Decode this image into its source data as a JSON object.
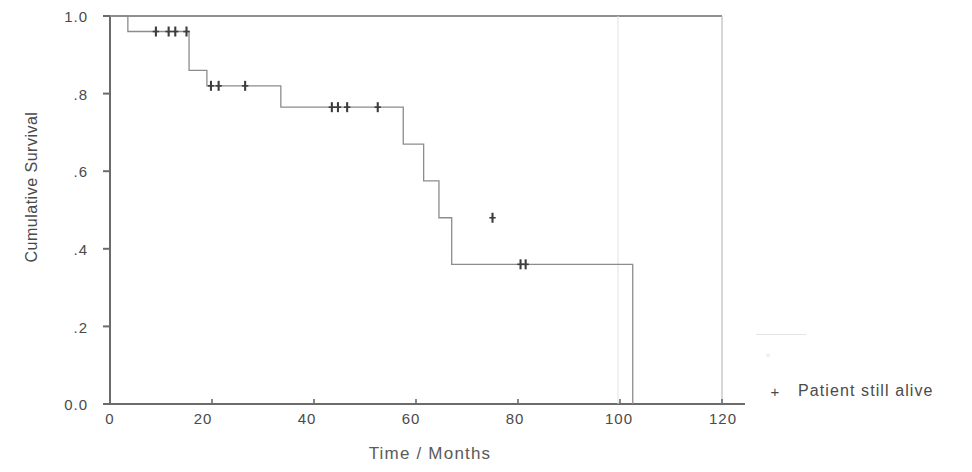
{
  "chart_data": {
    "type": "line",
    "title": "",
    "xlabel": "Time / Months",
    "ylabel": "Cumulative Survival",
    "xlim": [
      0,
      120
    ],
    "ylim": [
      0.0,
      1.0
    ],
    "grid": false,
    "legend_position": "right",
    "x_ticks": [
      0,
      20,
      40,
      60,
      80,
      100,
      120
    ],
    "x_tick_labels": [
      "0",
      "20",
      "40",
      "60",
      "80",
      "100",
      "120"
    ],
    "y_ticks": [
      0.0,
      0.2,
      0.4,
      0.6,
      0.8,
      1.0
    ],
    "y_tick_labels": [
      "0.0",
      ".2",
      ".4",
      ".6",
      ".8",
      "1.0"
    ],
    "series": [
      {
        "name": "Survival function",
        "style": "step",
        "color": "#8c8c8c",
        "x": [
          0,
          3.5,
          3.5,
          15.5,
          15.5,
          19.0,
          19.0,
          33.5,
          33.5,
          57.5,
          57.5,
          61.5,
          61.5,
          64.5,
          64.5,
          67.0,
          67.0,
          77.5,
          77.5,
          102.5,
          102.5
        ],
        "y": [
          1.0,
          1.0,
          0.96,
          0.96,
          0.86,
          0.86,
          0.82,
          0.82,
          0.765,
          0.765,
          0.67,
          0.67,
          0.575,
          0.575,
          0.48,
          0.48,
          0.36,
          0.36,
          0.36,
          0.36,
          0.0
        ]
      }
    ],
    "censor_marks": {
      "name": "Patient still alive",
      "symbol": "+",
      "color": "#3d3d3d",
      "points": [
        {
          "x": 9.0,
          "y": 0.96
        },
        {
          "x": 11.5,
          "y": 0.96
        },
        {
          "x": 12.8,
          "y": 0.96
        },
        {
          "x": 15.0,
          "y": 0.96
        },
        {
          "x": 19.8,
          "y": 0.82
        },
        {
          "x": 21.3,
          "y": 0.82
        },
        {
          "x": 26.5,
          "y": 0.82
        },
        {
          "x": 43.5,
          "y": 0.765
        },
        {
          "x": 44.7,
          "y": 0.765
        },
        {
          "x": 46.5,
          "y": 0.765
        },
        {
          "x": 52.5,
          "y": 0.765
        },
        {
          "x": 75.0,
          "y": 0.48
        },
        {
          "x": 80.5,
          "y": 0.36
        },
        {
          "x": 81.5,
          "y": 0.36
        }
      ]
    },
    "legend": {
      "entries": [
        {
          "label": "",
          "marker": "line",
          "faded": true
        },
        {
          "label": "Patient still alive",
          "marker": "+",
          "faded": false
        }
      ]
    }
  },
  "axes": {
    "y_title": "Cumulative Survival",
    "x_title": "Time / Months",
    "y_tick_labels": [
      "1.0",
      ".8",
      ".6",
      ".4",
      ".2",
      "0.0"
    ],
    "x_tick_labels": [
      "0",
      "20",
      "40",
      "60",
      "80",
      "100",
      "120"
    ]
  },
  "legend": {
    "faded_label": "",
    "faded_glyph": "▫",
    "alive_symbol": "+",
    "alive_label": "Patient still alive"
  }
}
